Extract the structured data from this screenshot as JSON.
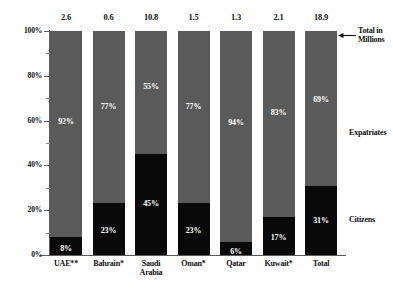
{
  "chart_data": {
    "type": "bar",
    "subtype": "stacked-100-percent",
    "title": "",
    "xlabel": "",
    "ylabel": "",
    "ylim": [
      0,
      100
    ],
    "ytick_labels": [
      "0%",
      "20%",
      "40%",
      "60%",
      "80%",
      "100%"
    ],
    "ytick_values": [
      0,
      20,
      40,
      60,
      80,
      100
    ],
    "minor_tick_interval": 10,
    "grid": false,
    "legend_position": "right-inline",
    "categories": [
      "UAE**",
      "Bahrain*",
      "Saudi\nArabia",
      "Oman*",
      "Qatar",
      "Kuwait*",
      "Total"
    ],
    "series": [
      {
        "name": "Citizens",
        "color": "#090909",
        "values": [
          8,
          23,
          45,
          23,
          6,
          17,
          31
        ],
        "value_labels": [
          "8%",
          "23%",
          "45%",
          "23%",
          "6%",
          "17%",
          "31%"
        ]
      },
      {
        "name": "Expatriates",
        "color": "#5a5a5a",
        "values": [
          92,
          77,
          55,
          77,
          94,
          83,
          69
        ],
        "value_labels": [
          "92%",
          "77%",
          "55%",
          "77%",
          "94%",
          "83%",
          "69%"
        ]
      }
    ],
    "annotations": {
      "totals_in_millions": {
        "label": "Total in\nMillions",
        "values": [
          2.6,
          0.6,
          10.8,
          1.5,
          1.3,
          2.1,
          18.9
        ],
        "value_labels": [
          "2.6",
          "0.6",
          "10.8",
          "1.5",
          "1.3",
          "2.1",
          "18.9"
        ]
      },
      "series_labels": {
        "expatriates": "Expatriates",
        "citizens": "Citizens"
      }
    }
  },
  "colors": {
    "citizens": "#090909",
    "expatriates": "#5a5a5a",
    "axis": "#5b5b5b",
    "background": "#ffffff",
    "value_text": "#ffffff"
  }
}
